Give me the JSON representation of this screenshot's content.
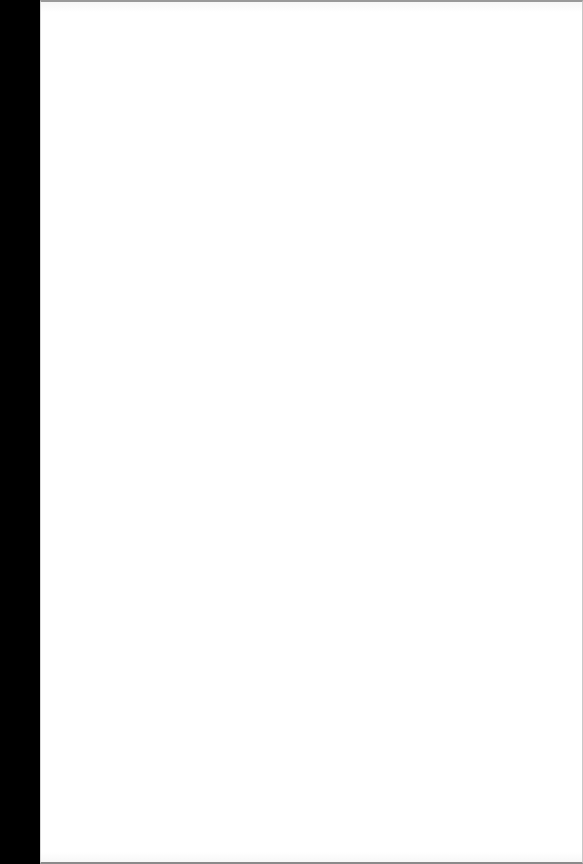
{
  "page": {
    "background_color": "#ffffff",
    "margin_color": "#000000",
    "content": []
  }
}
